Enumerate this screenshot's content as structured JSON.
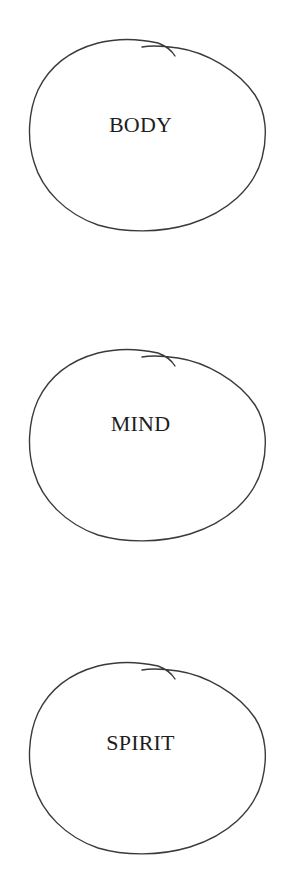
{
  "diagram": {
    "type": "stacked-hand-drawn-loops",
    "stroke_color": "#3a3a3a",
    "text_color": "#1e1e1e",
    "background": "#ffffff",
    "loops": [
      {
        "label": "BODY"
      },
      {
        "label": "MIND"
      },
      {
        "label": "SPIRIT"
      }
    ]
  }
}
